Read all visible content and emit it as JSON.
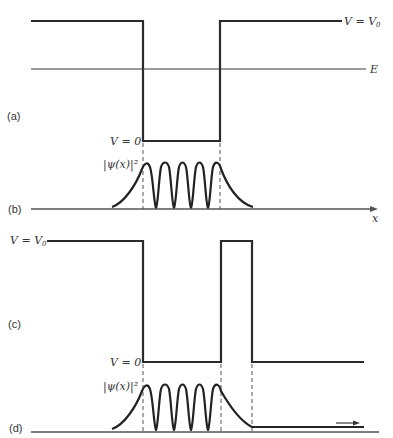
{
  "figure": {
    "panels": [
      {
        "id": "a",
        "label": "(a)",
        "description": "finite square well potential V(x) with energy level E"
      },
      {
        "id": "b",
        "label": "(b)",
        "description": "probability density |psi(x)|^2 for bound state in well"
      },
      {
        "id": "c",
        "label": "(c)",
        "description": "well with finite-width barrier on right side"
      },
      {
        "id": "d",
        "label": "(d)",
        "description": "probability density showing tunneling through barrier"
      }
    ],
    "labels": {
      "v_eq_v0_top": "V = V",
      "v0_sub": "0",
      "energy": "E",
      "v_eq_0_a": "V = 0",
      "psi_b": "|ψ(x)|²",
      "x_axis": "x",
      "v_eq_v0_c": "V = V",
      "v0_sub_c": "0",
      "v_eq_0_c": "V = 0",
      "psi_d": "|ψ(x)|²"
    },
    "geometry": {
      "well_left_x": 143,
      "well_right_x": 220,
      "barrier_right_x": 252,
      "peaks": 5
    }
  }
}
